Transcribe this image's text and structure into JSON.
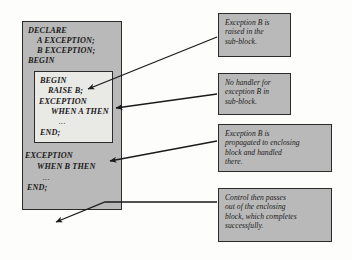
{
  "diagram": {
    "colors": {
      "block_fill": "#b9b9b9",
      "subblock_fill": "#e9e9e6",
      "border": "#2b2b2b",
      "text": "#1a1a1a",
      "background": "#fdfdfc"
    }
  },
  "outer_block": {
    "name": "enclosing-block",
    "lines": [
      {
        "text": "DECLARE",
        "indent": 0
      },
      {
        "text": "A EXCEPTION;",
        "indent": 1
      },
      {
        "text": "B EXCEPTION;",
        "indent": 1
      },
      {
        "text": "BEGIN",
        "indent": 0
      }
    ],
    "handler_lines": [
      {
        "text": "EXCEPTION",
        "indent": 0
      },
      {
        "text": "WHEN B THEN",
        "indent": 1
      },
      {
        "text": "...",
        "indent": 1,
        "dots": true
      },
      {
        "text": "END;",
        "indent": 0
      }
    ]
  },
  "inner_block": {
    "name": "sub-block",
    "lines": [
      {
        "text": "BEGIN",
        "indent": 0
      },
      {
        "text": "RAISE B;",
        "indent": 1
      },
      {
        "text": "EXCEPTION",
        "indent": 0
      },
      {
        "text": "WHEN A THEN",
        "indent": 1
      },
      {
        "text": "...",
        "indent": 1,
        "dots": true
      },
      {
        "text": "END;",
        "indent": 0
      }
    ]
  },
  "callouts": [
    {
      "id": "callout-1",
      "name": "callout-exception-raised",
      "lines": [
        "Exception B is",
        "raised in the",
        "sub-block."
      ]
    },
    {
      "id": "callout-2",
      "name": "callout-no-handler",
      "lines": [
        "No handler for",
        "exception B in",
        "sub-block."
      ]
    },
    {
      "id": "callout-3",
      "name": "callout-propagated",
      "lines": [
        "Exception B is",
        "propagated to enclosing",
        "block and handled",
        "there."
      ]
    },
    {
      "id": "callout-4",
      "name": "callout-control-passes",
      "lines": [
        "Control then passes",
        "out of the enclosing",
        "block, which completes",
        "successfully."
      ]
    }
  ]
}
